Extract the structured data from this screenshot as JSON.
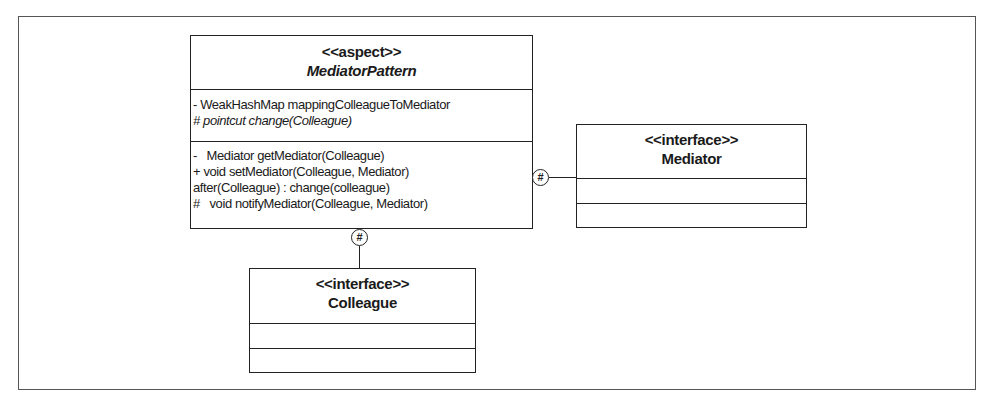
{
  "diagram": {
    "type": "uml-class-diagram",
    "classes": {
      "mediator_pattern": {
        "stereotype": "<<aspect>>",
        "name": "MediatorPattern",
        "name_style": "italic-bold",
        "attributes": [
          {
            "visibility": "-",
            "text": "WeakHashMap mappingColleagueToMediator",
            "italic": false
          },
          {
            "visibility": "#",
            "text": "pointcut change(Colleague)",
            "italic": true
          }
        ],
        "operations": [
          {
            "visibility": "-",
            "text": "Mediator getMediator(Colleague)"
          },
          {
            "visibility": "+",
            "text": "void setMediator(Colleague, Mediator)"
          },
          {
            "visibility": "",
            "text": "after(Colleague) : change(colleague)"
          },
          {
            "visibility": "#",
            "text": "void notifyMediator(Colleague, Mediator)"
          }
        ]
      },
      "mediator": {
        "stereotype": "<<interface>>",
        "name": "Mediator",
        "attributes": [],
        "operations": []
      },
      "colleague": {
        "stereotype": "<<interface>>",
        "name": "Colleague",
        "attributes": [],
        "operations": []
      }
    },
    "relationships": [
      {
        "from": "MediatorPattern",
        "to": "Mediator",
        "adornment": "#",
        "kind": "nested-protected"
      },
      {
        "from": "MediatorPattern",
        "to": "Colleague",
        "adornment": "#",
        "kind": "nested-protected"
      }
    ]
  }
}
